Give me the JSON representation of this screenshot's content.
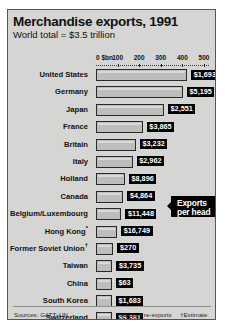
{
  "header": {
    "title": "Merchandise exports, 1991",
    "subtitle": "World total = $3.5 trillion"
  },
  "axis": {
    "unit_label": "0 $bn",
    "ticks": [
      "100",
      "200",
      "300",
      "400",
      "500"
    ]
  },
  "callout": {
    "line1": "Exports",
    "line2": "per head"
  },
  "footer": {
    "sources": "Sources: GATT; UN",
    "note_asterisk": "*includes re-exports",
    "note_dagger": "†Estimate"
  },
  "chart_data": {
    "type": "bar",
    "title": "Merchandise exports, 1991",
    "subtitle": "World total = $3.5 trillion",
    "xlabel": "$bn",
    "ylabel": "",
    "xlim": [
      0,
      520
    ],
    "grid": false,
    "orientation": "horizontal",
    "legend": "none",
    "annotations": [
      "Exports per head"
    ],
    "categories": [
      "United States",
      "Germany",
      "Japan",
      "France",
      "Britain",
      "Italy",
      "Holland",
      "Canada",
      "Belgium/Luxembourg",
      "Hong Kong*",
      "Former Soviet Union†",
      "Taiwan",
      "China",
      "South Korea",
      "Switzerland"
    ],
    "values": [
      422,
      403,
      315,
      217,
      185,
      170,
      134,
      127,
      118,
      98,
      81,
      76,
      72,
      72,
      61
    ],
    "rows": [
      {
        "country": "United States",
        "marker": "",
        "exports_bn": 422,
        "per_head": "$1,693"
      },
      {
        "country": "Germany",
        "marker": "",
        "exports_bn": 403,
        "per_head": "$5,195"
      },
      {
        "country": "Japan",
        "marker": "",
        "exports_bn": 315,
        "per_head": "$2,551"
      },
      {
        "country": "France",
        "marker": "",
        "exports_bn": 217,
        "per_head": "$3,865"
      },
      {
        "country": "Britain",
        "marker": "",
        "exports_bn": 185,
        "per_head": "$3,232"
      },
      {
        "country": "Italy",
        "marker": "",
        "exports_bn": 170,
        "per_head": "$2,962"
      },
      {
        "country": "Holland",
        "marker": "",
        "exports_bn": 134,
        "per_head": "$8,896"
      },
      {
        "country": "Canada",
        "marker": "",
        "exports_bn": 127,
        "per_head": "$4,864"
      },
      {
        "country": "Belgium/Luxembourg",
        "marker": "",
        "exports_bn": 118,
        "per_head": "$11,448"
      },
      {
        "country": "Hong Kong",
        "marker": "*",
        "exports_bn": 98,
        "per_head": "$16,749"
      },
      {
        "country": "Former Soviet Union",
        "marker": "†",
        "exports_bn": 81,
        "per_head": "$270"
      },
      {
        "country": "Taiwan",
        "marker": "",
        "exports_bn": 76,
        "per_head": "$3,735"
      },
      {
        "country": "China",
        "marker": "",
        "exports_bn": 72,
        "per_head": "$63"
      },
      {
        "country": "South Korea",
        "marker": "",
        "exports_bn": 72,
        "per_head": "$1,683"
      },
      {
        "country": "Switzerland",
        "marker": "",
        "exports_bn": 61,
        "per_head": "$9,381"
      }
    ]
  },
  "colors": {
    "card_background": "#d5d5d3",
    "bar_fill": "#bdbdbb",
    "bar_border": "#2a2a28",
    "badge_background": "#000000",
    "badge_text": "#ffffff",
    "text": "#111111"
  }
}
